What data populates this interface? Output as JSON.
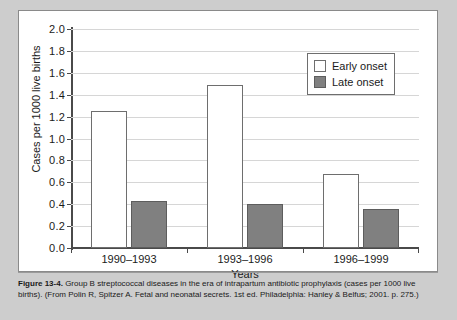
{
  "chart_data": {
    "type": "bar",
    "title": "",
    "categories": [
      "1990–1993",
      "1993–1996",
      "1996–1999"
    ],
    "series": [
      {
        "name": "Early onset",
        "values": [
          1.25,
          1.49,
          0.68
        ],
        "color": "#ffffff"
      },
      {
        "name": "Late onset",
        "values": [
          0.43,
          0.4,
          0.36
        ],
        "color": "#808080"
      }
    ],
    "xlabel": "Years",
    "ylabel": "Cases per 1000 live births",
    "ylim": [
      0.0,
      2.0
    ],
    "ytick_step": 0.2,
    "yticks": [
      "0.0",
      "0.2",
      "0.4",
      "0.6",
      "0.8",
      "1.0",
      "1.2",
      "1.4",
      "1.6",
      "1.8",
      "2.0"
    ],
    "grid": true,
    "legend_position": "top-right"
  },
  "legend": {
    "items": [
      {
        "label": "Early onset",
        "swatch": "white-square"
      },
      {
        "label": "Late onset",
        "swatch": "gray-square"
      }
    ]
  },
  "caption": {
    "label": "Figure 13-4.",
    "text": " Group B streptococcal diseases in the era of intrapartum antibiotic prophylaxis (cases per 1000 live births). (From Polin R, Spitzer A. Fetal and neonatal secrets. 1st ed. Philadelphia: Hanley & Belfus; 2001. p. 275.)"
  },
  "colors": {
    "page_background": "#cdcdcd",
    "card_background": "#ffffff",
    "axis": "#4a4a4a",
    "gridline": "#d6d6d6",
    "bar_late": "#808080",
    "bar_early_border": "#6e6e6e"
  }
}
